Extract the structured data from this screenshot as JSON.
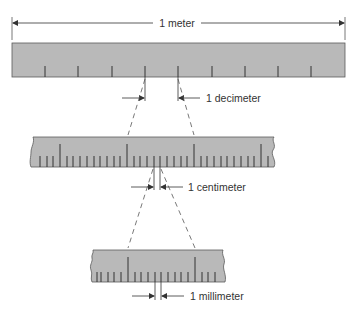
{
  "diagram": {
    "colors": {
      "ruler_fill": "#b9b9b9",
      "ruler_edge": "#5a5a5a",
      "tick": "#333333",
      "line": "#333333",
      "background": "#ffffff"
    },
    "labels": {
      "meter": "1 meter",
      "decimeter": "1 decimeter",
      "centimeter": "1 centimeter",
      "millimeter": "1 millimeter"
    },
    "rulers": [
      {
        "name": "meter-ruler",
        "divisions": 10,
        "unit": "decimeter"
      },
      {
        "name": "decimeter-ruler",
        "divisions": 10,
        "unit": "centimeter",
        "magnified": true
      },
      {
        "name": "centimeter-ruler",
        "divisions": 10,
        "unit": "millimeter",
        "magnified": true
      }
    ]
  }
}
